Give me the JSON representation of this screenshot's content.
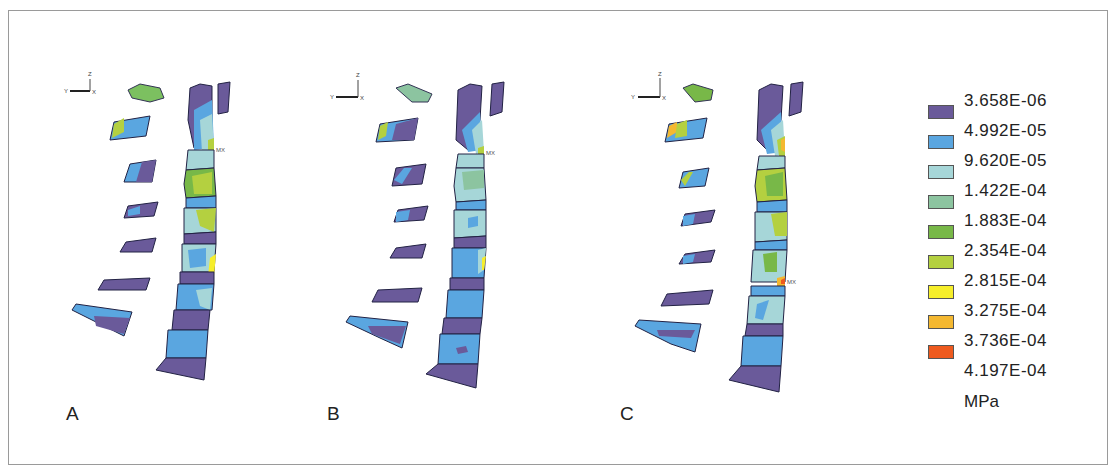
{
  "figure": {
    "panels": [
      {
        "id": "A",
        "label": "A"
      },
      {
        "id": "B",
        "label": "B"
      },
      {
        "id": "C",
        "label": "C"
      }
    ],
    "axis_triad": {
      "y_label": "Y",
      "z_label": "Z",
      "x_label": "X"
    },
    "max_marker": "MX"
  },
  "legend": {
    "unit": "MPa",
    "levels": [
      {
        "value": "3.658E-06",
        "color": "#6a5a9a"
      },
      {
        "value": "4.992E-05",
        "color": "#5aa6e0"
      },
      {
        "value": "9.620E-05",
        "color": "#a6d6d8"
      },
      {
        "value": "1.422E-04",
        "color": "#8cc4a0"
      },
      {
        "value": "1.883E-04",
        "color": "#78b848"
      },
      {
        "value": "2.354E-04",
        "color": "#b4d040"
      },
      {
        "value": "2.815E-04",
        "color": "#f6ee2a"
      },
      {
        "value": "3.275E-04",
        "color": "#f4b830"
      },
      {
        "value": "3.736E-04",
        "color": "#ee5a1e"
      },
      {
        "value": "4.197E-04",
        "color": null
      }
    ]
  }
}
